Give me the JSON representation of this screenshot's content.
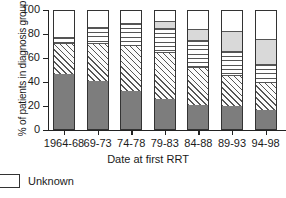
{
  "chart_data": {
    "type": "bar",
    "subtype": "stacked-percent",
    "title": "",
    "xlabel": "Date at first RRT",
    "ylabel": "% of patients in diagnosis group",
    "ylim": [
      0,
      100
    ],
    "yticks": [
      0,
      20,
      40,
      60,
      80,
      100
    ],
    "ytick_labels": [
      "0",
      "20",
      "40",
      "60",
      "80",
      "100"
    ],
    "grid": false,
    "legend_position": "below-left",
    "categories": [
      "1964-68",
      "69-73",
      "74-78",
      "79-83",
      "84-88",
      "89-93",
      "94-98"
    ],
    "series": [
      {
        "name": "Diagnosis group 1",
        "fill": "dark-gray",
        "color": "#7d7d7d",
        "values": [
          46,
          40,
          32,
          25,
          20,
          19,
          16
        ]
      },
      {
        "name": "Diagnosis group 2",
        "fill": "diagonal-hatch",
        "color": "#ffffff",
        "values": [
          26,
          32,
          38,
          39,
          32,
          26,
          23
        ]
      },
      {
        "name": "Diagnosis group 3",
        "fill": "horizontal-lines",
        "color": "#ffffff",
        "values": [
          5,
          13,
          18,
          20,
          22,
          20,
          15
        ]
      },
      {
        "name": "Diagnosis group 4",
        "fill": "light-gray",
        "color": "#d9d9d9",
        "values": [
          0,
          0,
          0,
          6,
          9,
          17,
          21
        ]
      },
      {
        "name": "Unknown",
        "fill": "white",
        "color": "#ffffff",
        "values": [
          23,
          15,
          12,
          10,
          17,
          18,
          25
        ]
      }
    ],
    "cumulative_tops": [
      [
        46,
        72,
        77,
        77,
        100
      ],
      [
        40,
        72,
        85,
        85,
        100
      ],
      [
        32,
        70,
        88,
        88,
        100
      ],
      [
        25,
        64,
        84,
        90,
        100
      ],
      [
        20,
        52,
        74,
        83,
        100
      ],
      [
        19,
        45,
        65,
        82,
        100
      ],
      [
        16,
        39,
        54,
        75,
        100
      ]
    ]
  },
  "legend": {
    "entries": [
      {
        "label": "Unknown",
        "swatch": "white"
      }
    ]
  }
}
